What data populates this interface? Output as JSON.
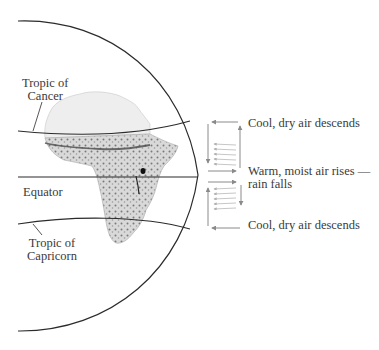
{
  "figure": {
    "globe_labels": {
      "tropic_of_cancer": [
        "Tropic of",
        "Cancer"
      ],
      "equator": "Equator",
      "tropic_of_capricorn": [
        "Tropic of",
        "Capricorn"
      ]
    },
    "circulation_labels": {
      "upper_descend": "Cool, dry air descends",
      "rise_line1": "Warm, moist air rises —",
      "rise_line2": "rain falls",
      "lower_descend": "Cool, dry air descends"
    },
    "colors": {
      "globe_line": "#2b2b2b",
      "arrow": "#8a8a8a",
      "arrow_light": "#b8b8b8",
      "continent_fill": "#e4e4e4",
      "vegetation": "#6e6e6e",
      "text": "#3a3a3a"
    }
  }
}
